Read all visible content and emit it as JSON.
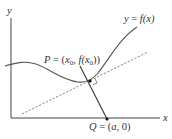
{
  "diagram": {
    "type": "normal-line-to-curve",
    "axes": {
      "x_label": "x",
      "y_label": "y"
    },
    "curve": {
      "label_lhs": "y",
      "label_eq": " = ",
      "label_rhs": "f(x)"
    },
    "point_p": {
      "name": "P",
      "eq": " = (",
      "x_base": "x",
      "x_sub": "0",
      "comma": ", ",
      "f_open": "f(x",
      "f_sub": "0",
      "close": "))"
    },
    "point_q": {
      "name": "Q",
      "eq": " = (",
      "a": "a",
      "rest": ", 0)"
    },
    "lines": {
      "tangent_style": "dashed",
      "normal_style": "solid"
    },
    "colors": {
      "stroke": "#444444",
      "dashed": "#777777",
      "text": "#333333",
      "background": "#ffffff"
    }
  }
}
